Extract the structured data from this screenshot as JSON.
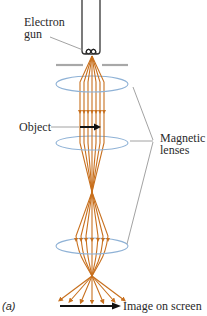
{
  "figure": {
    "panel_label": "(a)",
    "labels": {
      "electron_gun_line1": "Electron",
      "electron_gun_line2": "gun",
      "object": "Object",
      "magnetic_lenses_line1": "Magnetic",
      "magnetic_lenses_line2": "lenses",
      "image_on_screen": "Image on screen"
    },
    "colors": {
      "electron_beam": "#c8701e",
      "lens": "#8fb2d6",
      "aperture": "#a8a8a8",
      "leader_line": "#8a8a8a",
      "gun": "#333333",
      "arrow": "#111111",
      "text": "#2a2a2a"
    },
    "components": [
      "Electron gun",
      "Aperture",
      "Condenser lens",
      "Object",
      "Objective lens",
      "Projector lens",
      "Screen"
    ]
  }
}
